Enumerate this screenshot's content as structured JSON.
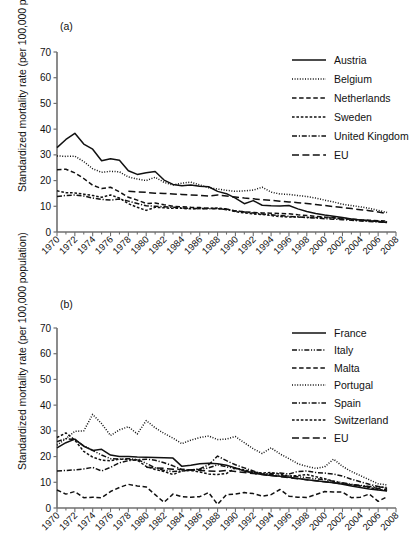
{
  "figure": {
    "ylabel": "Standardized mortality rate (per 100,000 population)",
    "xlabel": "",
    "ylim": [
      0,
      70
    ],
    "yticks": [
      0,
      10,
      20,
      30,
      40,
      50,
      60,
      70
    ],
    "xlim": [
      1970,
      2008
    ],
    "xticks": [
      1970,
      1972,
      1974,
      1976,
      1978,
      1980,
      1982,
      1984,
      1986,
      1988,
      1990,
      1992,
      1994,
      1996,
      1998,
      2000,
      2002,
      2004,
      2006,
      2008
    ],
    "xtick_labels": [
      "1970",
      "1972",
      "1974",
      "1976",
      "1978",
      "1980",
      "1982",
      "1984",
      "1986",
      "1988",
      "1990",
      "1992",
      "1994",
      "1996",
      "1998",
      "2000",
      "2002",
      "2004",
      "2006",
      "2008"
    ],
    "grid": false,
    "legend_position": "upper right",
    "line_color": "#111111"
  },
  "panel_a": {
    "tag": "(a)",
    "ylabel": "Standardized mortality rate (per 100,000 population)",
    "legend": [
      {
        "label": "Austria",
        "dash": "solid"
      },
      {
        "label": "Belgium",
        "dash": "dotted"
      },
      {
        "label": "Netherlands",
        "dash": "dashed"
      },
      {
        "label": "Sweden",
        "dash": "short-dash"
      },
      {
        "label": "United Kingdom",
        "dash": "dash-dot"
      },
      {
        "label": "EU",
        "dash": "long-dash"
      }
    ]
  },
  "panel_b": {
    "tag": "(b)",
    "ylabel": "Standardized mortality rate (per 100,000 population)",
    "legend": [
      {
        "label": "France",
        "dash": "solid"
      },
      {
        "label": "Italy",
        "dash": "dash-dot-dot"
      },
      {
        "label": "Malta",
        "dash": "dashed"
      },
      {
        "label": "Portugal",
        "dash": "dotted"
      },
      {
        "label": "Spain",
        "dash": "dash-dot"
      },
      {
        "label": "Switzerland",
        "dash": "short-dash"
      },
      {
        "label": "EU",
        "dash": "long-dash"
      }
    ]
  },
  "chart_data": [
    {
      "type": "line",
      "panel": "(a)",
      "title": "",
      "xlabel": "",
      "ylabel": "Standardized mortality rate (per 100,000 population)",
      "ylim": [
        0,
        70
      ],
      "xlim": [
        1970,
        2008
      ],
      "grid": false,
      "legend_position": "upper right",
      "x": [
        1970,
        1971,
        1972,
        1973,
        1974,
        1975,
        1976,
        1977,
        1978,
        1979,
        1980,
        1981,
        1982,
        1983,
        1984,
        1985,
        1986,
        1987,
        1988,
        1989,
        1990,
        1991,
        1992,
        1993,
        1994,
        1995,
        1996,
        1997,
        1998,
        1999,
        2000,
        2001,
        2002,
        2003,
        2004,
        2005,
        2006,
        2007
      ],
      "series": [
        {
          "name": "Austria",
          "dash": "solid",
          "values": [
            32.8,
            36.0,
            38.4,
            34.2,
            32.2,
            27.7,
            28.5,
            27.9,
            23.8,
            22.4,
            23.0,
            23.5,
            20.2,
            18.5,
            18.0,
            18.3,
            17.8,
            17.6,
            15.8,
            14.9,
            13.2,
            11.0,
            12.2,
            10.4,
            10.2,
            10.1,
            10.3,
            9.0,
            8.0,
            7.2,
            6.6,
            6.1,
            5.6,
            5.1,
            4.7,
            4.4,
            4.1,
            3.7
          ]
        },
        {
          "name": "Belgium",
          "dash": "dotted",
          "values": [
            29.6,
            29.4,
            29.5,
            27.4,
            24.6,
            23.2,
            23.6,
            23.4,
            21.4,
            20.6,
            20.0,
            21.3,
            19.3,
            18.3,
            19.0,
            19.4,
            18.3,
            17.2,
            16.7,
            16.2,
            15.8,
            16.0,
            16.3,
            17.4,
            15.5,
            14.8,
            14.6,
            14.2,
            13.8,
            13.2,
            12.4,
            11.7,
            10.8,
            10.3,
            9.8,
            9.2,
            8.4,
            7.6
          ]
        },
        {
          "name": "Netherlands",
          "dash": "dashed",
          "values": [
            24.2,
            24.4,
            23.0,
            20.8,
            18.2,
            16.9,
            17.4,
            15.6,
            13.5,
            12.4,
            11.1,
            11.3,
            10.6,
            10.0,
            9.8,
            9.6,
            9.5,
            9.2,
            9.1,
            8.9,
            8.2,
            7.8,
            7.6,
            7.4,
            7.3,
            7.2,
            7.1,
            6.7,
            6.4,
            6.1,
            5.8,
            5.6,
            5.3,
            5.0,
            4.7,
            4.6,
            4.4,
            4.2
          ]
        },
        {
          "name": "Sweden",
          "dash": "short-dash",
          "values": [
            16.0,
            15.3,
            15.2,
            14.7,
            14.2,
            13.5,
            14.4,
            13.2,
            11.0,
            9.6,
            8.4,
            9.6,
            9.4,
            9.2,
            9.2,
            9.0,
            9.1,
            9.2,
            9.3,
            9.0,
            7.9,
            7.4,
            7.0,
            6.8,
            6.4,
            6.0,
            5.8,
            5.8,
            5.7,
            5.6,
            5.6,
            5.4,
            5.1,
            4.9,
            4.6,
            4.4,
            4.2,
            3.9
          ]
        },
        {
          "name": "United Kingdom",
          "dash": "dash-dot",
          "values": [
            13.8,
            14.2,
            14.4,
            14.0,
            13.2,
            12.7,
            12.4,
            12.8,
            12.0,
            11.1,
            10.2,
            10.0,
            9.8,
            9.6,
            9.4,
            9.2,
            9.1,
            9.0,
            9.1,
            8.7,
            8.2,
            7.8,
            7.4,
            7.0,
            6.7,
            6.4,
            6.1,
            5.9,
            5.6,
            5.4,
            5.2,
            5.0,
            4.8,
            4.6,
            4.3,
            4.1,
            3.9,
            3.7
          ]
        },
        {
          "name": "EU",
          "dash": "long-dash",
          "values": [
            null,
            null,
            null,
            null,
            null,
            null,
            null,
            null,
            15.8,
            15.6,
            15.4,
            15.1,
            15.0,
            14.8,
            14.6,
            14.4,
            14.2,
            14.0,
            14.4,
            14.0,
            13.6,
            13.2,
            12.9,
            12.6,
            12.3,
            12.0,
            11.7,
            11.4,
            11.1,
            10.7,
            10.3,
            9.9,
            9.5,
            9.1,
            8.7,
            8.3,
            7.8,
            7.2
          ]
        }
      ]
    },
    {
      "type": "line",
      "panel": "(b)",
      "title": "",
      "xlabel": "",
      "ylabel": "Standardized mortality rate (per 100,000 population)",
      "ylim": [
        0,
        70
      ],
      "xlim": [
        1970,
        2008
      ],
      "grid": false,
      "legend_position": "upper right",
      "x": [
        1970,
        1971,
        1972,
        1973,
        1974,
        1975,
        1976,
        1977,
        1978,
        1979,
        1980,
        1981,
        1982,
        1983,
        1984,
        1985,
        1986,
        1987,
        1988,
        1989,
        1990,
        1991,
        1992,
        1993,
        1994,
        1995,
        1996,
        1997,
        1998,
        1999,
        2000,
        2001,
        2002,
        2003,
        2004,
        2005,
        2006,
        2007
      ],
      "series": [
        {
          "name": "France",
          "dash": "solid",
          "values": [
            23.4,
            25.4,
            26.8,
            24.0,
            22.4,
            22.8,
            20.6,
            20.0,
            20.0,
            19.8,
            19.7,
            19.6,
            19.5,
            19.4,
            16.2,
            16.6,
            17.2,
            17.4,
            17.2,
            16.6,
            15.6,
            14.4,
            13.6,
            13.0,
            12.6,
            12.3,
            12.0,
            11.5,
            11.0,
            10.6,
            10.2,
            9.8,
            9.2,
            8.6,
            8.0,
            7.4,
            7.0,
            6.6
          ]
        },
        {
          "name": "Italy",
          "dash": "dash-dot-dot",
          "values": [
            25.8,
            27.0,
            26.6,
            24.2,
            22.4,
            20.6,
            19.2,
            19.0,
            19.2,
            18.8,
            17.4,
            15.6,
            14.6,
            14.2,
            14.4,
            14.8,
            15.0,
            15.6,
            16.8,
            16.0,
            15.4,
            14.4,
            13.8,
            13.4,
            13.0,
            12.6,
            12.4,
            12.2,
            11.8,
            11.4,
            11.0,
            10.4,
            9.8,
            9.2,
            8.8,
            8.4,
            8.2,
            8.0
          ]
        },
        {
          "name": "Malta",
          "dash": "dashed",
          "values": [
            7.0,
            5.4,
            6.4,
            4.0,
            4.2,
            4.0,
            6.4,
            8.0,
            9.2,
            8.6,
            8.2,
            5.2,
            2.2,
            5.4,
            4.4,
            4.2,
            4.4,
            6.0,
            1.4,
            5.2,
            5.4,
            6.0,
            5.6,
            4.6,
            5.2,
            7.2,
            4.6,
            4.2,
            4.1,
            5.2,
            6.4,
            6.2,
            6.2,
            4.0,
            4.2,
            5.4,
            2.6,
            4.4
          ]
        },
        {
          "name": "Portugal",
          "dash": "dotted",
          "values": [
            24.4,
            27.0,
            29.8,
            30.0,
            36.4,
            32.8,
            28.2,
            30.4,
            31.6,
            28.8,
            34.0,
            31.2,
            29.0,
            27.2,
            25.0,
            26.4,
            27.4,
            28.0,
            26.6,
            26.8,
            27.8,
            25.4,
            23.0,
            21.2,
            23.4,
            21.0,
            19.2,
            17.2,
            16.2,
            15.4,
            16.0,
            19.0,
            16.2,
            14.2,
            12.6,
            11.0,
            9.4,
            9.0
          ]
        },
        {
          "name": "Spain",
          "dash": "dash-dot",
          "values": [
            14.4,
            14.6,
            14.8,
            15.2,
            15.8,
            14.4,
            15.8,
            17.6,
            18.4,
            18.8,
            19.0,
            18.6,
            17.6,
            16.4,
            15.0,
            14.8,
            15.2,
            16.8,
            20.2,
            18.4,
            16.8,
            15.6,
            14.4,
            13.2,
            13.4,
            13.6,
            13.2,
            14.2,
            14.4,
            13.8,
            13.6,
            13.2,
            12.4,
            11.2,
            10.2,
            9.2,
            8.4,
            7.6
          ]
        },
        {
          "name": "Switzerland",
          "dash": "short-dash",
          "values": [
            27.4,
            29.2,
            26.4,
            22.0,
            19.8,
            18.6,
            18.4,
            19.0,
            18.8,
            18.6,
            16.2,
            15.0,
            14.2,
            13.0,
            14.4,
            14.6,
            14.0,
            13.2,
            13.0,
            13.4,
            15.6,
            14.8,
            14.0,
            13.6,
            13.8,
            13.2,
            12.4,
            12.6,
            13.0,
            12.2,
            11.4,
            10.4,
            9.6,
            9.0,
            8.6,
            8.0,
            7.2,
            6.8
          ]
        },
        {
          "name": "EU",
          "dash": "long-dash",
          "values": [
            null,
            null,
            null,
            null,
            null,
            null,
            null,
            null,
            null,
            null,
            15.8,
            15.6,
            15.4,
            15.1,
            15.0,
            14.8,
            14.6,
            14.4,
            14.2,
            14.6,
            14.2,
            13.8,
            13.4,
            13.0,
            12.6,
            12.2,
            11.8,
            11.4,
            11.0,
            10.6,
            10.2,
            9.8,
            9.4,
            9.0,
            8.6,
            8.2,
            7.6,
            7.0
          ]
        }
      ]
    }
  ]
}
